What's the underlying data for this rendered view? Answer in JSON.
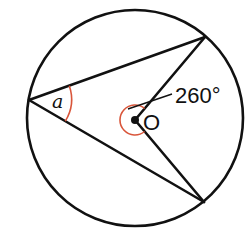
{
  "diagram": {
    "type": "circle-theorem",
    "circle": {
      "cx": 135,
      "cy": 118,
      "r": 108
    },
    "center": {
      "label": "O",
      "x": 135,
      "y": 120
    },
    "points": {
      "left": {
        "x": 29,
        "y": 100
      },
      "top_right": {
        "x": 205,
        "y": 37
      },
      "bottom_right": {
        "x": 204,
        "y": 202
      }
    },
    "labels": {
      "inscribed_angle": "a",
      "center_label": "O",
      "reflex_angle": "260°"
    },
    "colors": {
      "stroke": "#111111",
      "angle_arc": "#d9553a"
    }
  }
}
